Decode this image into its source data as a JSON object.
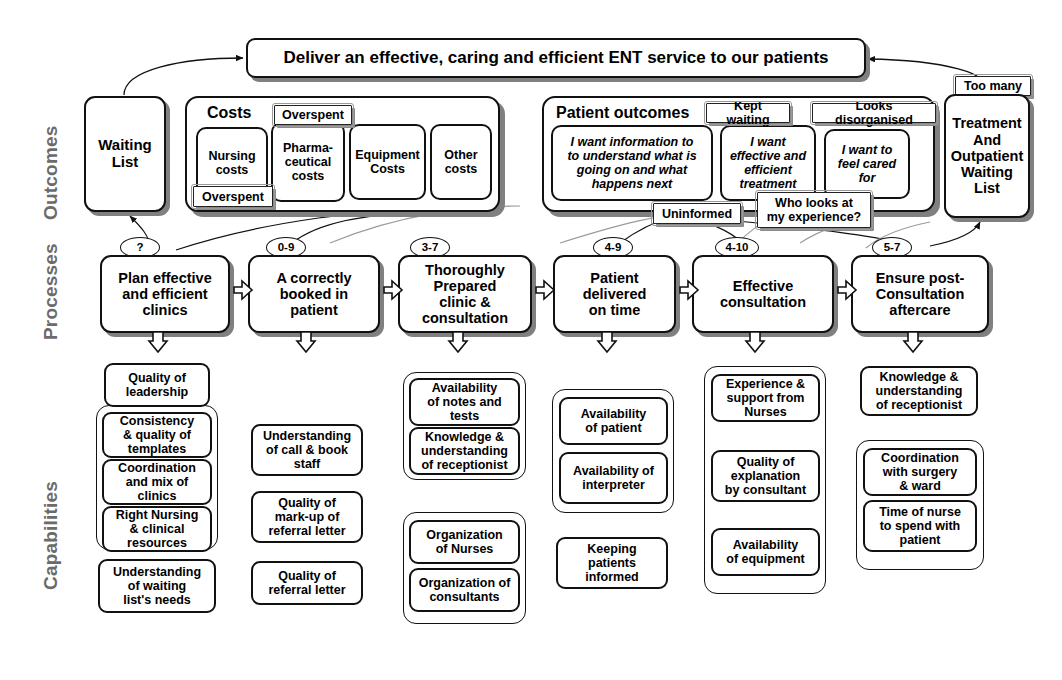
{
  "diagram": {
    "title_banner": "Deliver an effective, caring and efficient ENT service to our patients",
    "row_labels": {
      "outcomes": "Outcomes",
      "processes": "Processes",
      "capabilities": "Capabilities"
    }
  },
  "outcomes": {
    "waiting_list": "Waiting\nList",
    "costs_group_label": "Costs",
    "costs": [
      "Nursing\ncosts",
      "Pharma-\nceutical\ncosts",
      "Equipment\nCosts",
      "Other\ncosts"
    ],
    "cost_tags": [
      {
        "label": "Overspent"
      },
      {
        "label": "Overspent"
      }
    ],
    "patient_outcomes_group_label": "Patient outcomes",
    "patient_voices": [
      "I want information to\nto understand what is\ngoing on and what\nhappens next",
      "I want\neffective and\nefficient\ntreatment",
      "I want to\nfeel cared\nfor"
    ],
    "patient_tags": [
      {
        "label": "Kept waiting"
      },
      {
        "label": "Looks disorganised"
      },
      {
        "label": "Uninformed"
      },
      {
        "label": "Who looks at\nmy experience?"
      }
    ],
    "treatment_tag": "Too many",
    "treatment_box": "Treatment\nAnd\nOutpatient\nWaiting\nList"
  },
  "processes": [
    {
      "badge": "?",
      "label": "Plan effective\nand efficient\nclinics"
    },
    {
      "badge": "0-9",
      "label": "A correctly\nbooked in\npatient"
    },
    {
      "badge": "3-7",
      "label": "Thoroughly\nPrepared\nclinic &\nconsultation"
    },
    {
      "badge": "4-9",
      "label": "Patient\ndelivered\non time"
    },
    {
      "badge": "4-10",
      "label": "Effective\nconsultation"
    },
    {
      "badge": "5-7",
      "label": "Ensure post-\nConsultation\naftercare"
    }
  ],
  "capabilities": [
    {
      "column": 1,
      "items": [
        {
          "label": "Quality of\nleadership",
          "grouped": false
        },
        {
          "label": "Consistency\n& quality of\ntemplates",
          "grouped": true
        },
        {
          "label": "Coordination\nand mix of\nclinics",
          "grouped": true
        },
        {
          "label": "Right Nursing\n& clinical\nresources",
          "grouped": true
        },
        {
          "label": "Understanding\nof waiting\nlist's needs",
          "grouped": false
        }
      ]
    },
    {
      "column": 2,
      "items": [
        {
          "label": "Understanding\nof call & book\nstaff",
          "grouped": false
        },
        {
          "label": "Quality of\nmark-up of\nreferral letter",
          "grouped": false
        },
        {
          "label": "Quality of\nreferral letter",
          "grouped": false
        }
      ]
    },
    {
      "column": 3,
      "items": [
        {
          "label": "Availability\nof notes and\ntests",
          "grouped": true
        },
        {
          "label": "Knowledge &\nunderstanding\nof receptionist",
          "grouped": true
        },
        {
          "label": "Organization\nof Nurses",
          "grouped": true
        },
        {
          "label": "Organization of\nconsultants",
          "grouped": true
        }
      ]
    },
    {
      "column": 4,
      "items": [
        {
          "label": "Availability\nof patient",
          "grouped": true
        },
        {
          "label": "Availability of\ninterpreter",
          "grouped": true
        },
        {
          "label": "Keeping\npatients\ninformed",
          "grouped": false
        }
      ]
    },
    {
      "column": 5,
      "items": [
        {
          "label": "Experience &\nsupport from\nNurses",
          "grouped": true
        },
        {
          "label": "Quality of\nexplanation\nby consultant",
          "grouped": true
        },
        {
          "label": "Availability\nof equipment",
          "grouped": true
        }
      ]
    },
    {
      "column": 6,
      "items": [
        {
          "label": "Knowledge &\nunderstanding\nof receptionist",
          "grouped": false
        },
        {
          "label": "Coordination\nwith surgery\n& ward",
          "grouped": true
        },
        {
          "label": "Time of nurse\nto spend with\npatient",
          "grouped": true
        }
      ]
    }
  ],
  "colors": {
    "outline": "#111111",
    "shadow": "#808080",
    "row_label": "#6b6b6b",
    "background": "#ffffff"
  }
}
